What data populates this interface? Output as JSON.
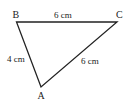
{
  "diagram": {
    "type": "triangle",
    "vertices": {
      "A": {
        "label": "A",
        "x": 41,
        "y": 87
      },
      "B": {
        "label": "B",
        "x": 16.5,
        "y": 22
      },
      "C": {
        "label": "C",
        "x": 117,
        "y": 22
      }
    },
    "sides": {
      "BC": {
        "label": "6 cm"
      },
      "AB": {
        "label": "4 cm"
      },
      "AC": {
        "label": "6 cm"
      }
    },
    "stroke_color": "#222222"
  }
}
